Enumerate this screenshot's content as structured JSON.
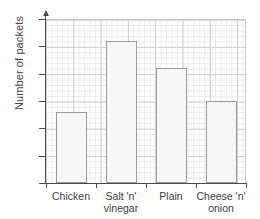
{
  "chart_data": {
    "type": "bar",
    "title": "",
    "xlabel": "",
    "ylabel": "Number of packets",
    "categories": [
      "Chicken",
      "Salt 'n' vinegar",
      "Plain",
      "Cheese 'n' onion"
    ],
    "category_lines": [
      [
        "Chicken"
      ],
      [
        "Salt 'n'",
        "vinegar"
      ],
      [
        "Plain"
      ],
      [
        "Cheese 'n'",
        "onion"
      ]
    ],
    "values": [
      13,
      26,
      21,
      15
    ],
    "ylim": [
      0,
      30
    ],
    "ytick_labels": [
      "0",
      "5",
      "10",
      "15",
      "20",
      "25",
      "30"
    ],
    "ytick_values": [
      0,
      5,
      10,
      15,
      20,
      25,
      30
    ],
    "grid": "graph-paper",
    "legend": "none",
    "bar_fill": "#f7f7f7",
    "bar_edge": "#9a9a9a",
    "axis_color": "#4a4a4a",
    "grid_major_color": "#cfcfcf",
    "grid_minor_color": "#ebebeb"
  }
}
